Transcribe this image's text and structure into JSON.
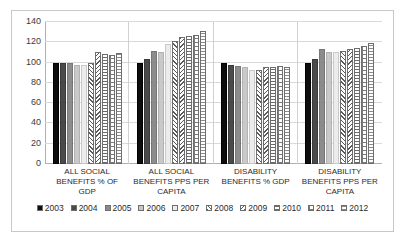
{
  "chart_data": {
    "type": "bar",
    "title": "",
    "xlabel": "",
    "ylabel": "",
    "ylim": [
      0,
      140
    ],
    "yticks": [
      0,
      20,
      40,
      60,
      80,
      100,
      120,
      140
    ],
    "grid": true,
    "legend_position": "bottom",
    "categories": [
      "ALL SOCIAL BENEFITS % OF GDP",
      "ALL SOCIAL BENEFITS PPS PER CAPITA",
      "DISABILITY BENEFITS % GDP",
      "DISABILITY BENEFITS PPS PER CAPITA"
    ],
    "series": [
      {
        "name": "2003",
        "values": [
          100,
          100,
          100,
          100
        ]
      },
      {
        "name": "2004",
        "values": [
          100,
          104,
          98,
          104
        ]
      },
      {
        "name": "2005",
        "values": [
          100,
          111,
          97,
          113
        ]
      },
      {
        "name": "2006",
        "values": [
          98,
          110,
          96,
          110
        ]
      },
      {
        "name": "2007",
        "values": [
          98,
          118,
          93,
          110
        ]
      },
      {
        "name": "2008",
        "values": [
          100,
          121,
          93,
          111
        ]
      },
      {
        "name": "2009",
        "values": [
          110,
          125,
          96,
          113
        ]
      },
      {
        "name": "2010",
        "values": [
          108,
          126,
          96,
          114
        ]
      },
      {
        "name": "2011",
        "values": [
          107,
          127,
          97,
          116
        ]
      },
      {
        "name": "2012",
        "values": [
          109,
          131,
          96,
          119
        ]
      }
    ]
  },
  "legend": {
    "items": [
      {
        "label": "2003"
      },
      {
        "label": "2004"
      },
      {
        "label": "2005"
      },
      {
        "label": "2006"
      },
      {
        "label": "2007"
      },
      {
        "label": "2008"
      },
      {
        "label": "2009"
      },
      {
        "label": "2010"
      },
      {
        "label": "2011"
      },
      {
        "label": "2012"
      }
    ]
  },
  "colors": {
    "background": "#ffffff",
    "border": "#c8c8c8",
    "gridline": "#d9d9d9",
    "axis": "#b0b0b0",
    "text": "#2b2b2b"
  }
}
